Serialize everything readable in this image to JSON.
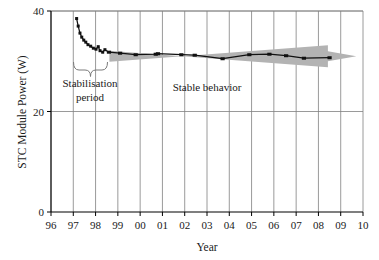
{
  "chart_data": {
    "type": "line",
    "title": "",
    "xlabel": "Year",
    "ylabel": "STC Module Power (W)",
    "xlim": [
      96,
      110
    ],
    "ylim": [
      0,
      40
    ],
    "yticks": [
      0,
      20,
      40
    ],
    "ytick_labels": [
      "0",
      "20",
      "40"
    ],
    "xticks": [
      96,
      97,
      98,
      99,
      100,
      101,
      102,
      103,
      104,
      105,
      106,
      107,
      108,
      109,
      110
    ],
    "xtick_labels": [
      "96",
      "97",
      "98",
      "99",
      "00",
      "01",
      "02",
      "03",
      "04",
      "05",
      "06",
      "07",
      "08",
      "09",
      "10"
    ],
    "grid": "vertical-and-horizontal",
    "legend": "none",
    "series": [
      {
        "name": "STC module power",
        "marker": "square",
        "color": "#111111",
        "points": [
          {
            "x": 97.15,
            "y": 38.5
          },
          {
            "x": 97.22,
            "y": 37.0
          },
          {
            "x": 97.3,
            "y": 35.6
          },
          {
            "x": 97.38,
            "y": 34.8
          },
          {
            "x": 97.47,
            "y": 34.2
          },
          {
            "x": 97.56,
            "y": 33.8
          },
          {
            "x": 97.66,
            "y": 33.3
          },
          {
            "x": 97.78,
            "y": 33.0
          },
          {
            "x": 97.9,
            "y": 32.6
          },
          {
            "x": 98.02,
            "y": 32.4
          },
          {
            "x": 98.12,
            "y": 32.9
          },
          {
            "x": 98.2,
            "y": 32.1
          },
          {
            "x": 98.32,
            "y": 31.8
          },
          {
            "x": 98.42,
            "y": 32.3
          },
          {
            "x": 98.6,
            "y": 31.8
          },
          {
            "x": 99.1,
            "y": 31.6
          },
          {
            "x": 99.8,
            "y": 31.3
          },
          {
            "x": 100.7,
            "y": 31.4
          },
          {
            "x": 100.8,
            "y": 31.5
          },
          {
            "x": 101.85,
            "y": 31.3
          },
          {
            "x": 102.45,
            "y": 31.2
          },
          {
            "x": 103.7,
            "y": 30.5
          },
          {
            "x": 104.9,
            "y": 31.3
          },
          {
            "x": 105.8,
            "y": 31.4
          },
          {
            "x": 106.55,
            "y": 31.1
          },
          {
            "x": 107.35,
            "y": 30.6
          },
          {
            "x": 108.5,
            "y": 30.7
          }
        ]
      }
    ],
    "annotations": [
      {
        "id": "stabilisation",
        "text_line1": "Stabilisation",
        "text_line2": "period",
        "x_range": [
          97.1,
          98.6
        ]
      },
      {
        "id": "stable",
        "text": "Stable behavior",
        "x_range": [
          98.6,
          110.0
        ]
      }
    ],
    "bands": [
      {
        "id": "stable-behavior-arrow",
        "shape": "tapered-arrow",
        "color": "#b3b3b3",
        "x_start": 98.62,
        "x_end": 109.7,
        "y_center": 31.2
      }
    ]
  },
  "colors": {
    "data_line": "#111111",
    "marker": "#111111",
    "arrow_band": "#b3b3b3",
    "grid": "#808080",
    "axis": "#000000",
    "text": "#1a1a1a"
  }
}
